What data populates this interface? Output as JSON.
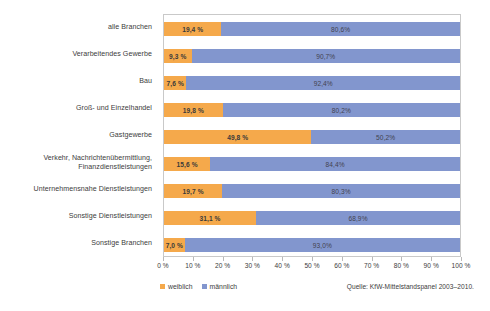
{
  "chart_data": {
    "type": "bar",
    "subtype": "stacked-horizontal-100",
    "title": "",
    "xlabel": "",
    "ylabel": "",
    "xlim": [
      0,
      100
    ],
    "xtick_labels": [
      "0 %",
      "10 %",
      "20 %",
      "30 %",
      "40 %",
      "50 %",
      "60 %",
      "70 %",
      "80 %",
      "90 %",
      "100 %"
    ],
    "xticks": [
      0,
      10,
      20,
      30,
      40,
      50,
      60,
      70,
      80,
      90,
      100
    ],
    "grid": false,
    "legend_position": "bottom-left",
    "categories": [
      "alle Branchen",
      "Verarbeitendes Gewerbe",
      "Bau",
      "Groß- und Einzelhandel",
      "Gastgewerbe",
      "Verkehr, Nachrichtenübermittlung,\nFinanzdienstleistungen",
      "Unternehmensnahe Dienstleistungen",
      "Sonstige Dienstleistungen",
      "Sonstige Branchen"
    ],
    "series": [
      {
        "name": "weiblich",
        "color": "#F5A94B",
        "values": [
          19.4,
          9.3,
          7.6,
          19.8,
          49.8,
          15.6,
          19.7,
          31.1,
          7.0
        ],
        "labels": [
          "19,4 %",
          "9,3 %",
          "7,6 %",
          "19,8 %",
          "49,8 %",
          "15,6 %",
          "19,7 %",
          "31,1 %",
          "7,0 %"
        ]
      },
      {
        "name": "männlich",
        "color": "#8296CE",
        "values": [
          80.6,
          90.7,
          92.4,
          80.2,
          50.2,
          84.4,
          80.3,
          68.9,
          93.0
        ],
        "labels": [
          "80,6%",
          "90,7%",
          "92,4%",
          "80,2%",
          "50,2%",
          "84,4%",
          "80,3%",
          "68,9%",
          "93,0%"
        ]
      }
    ],
    "source_note": "Quelle: KfW-Mittelstandspanel 2003–2010."
  },
  "legend": {
    "items": [
      {
        "label": "weiblich",
        "color": "#F5A94B"
      },
      {
        "label": "männlich",
        "color": "#8296CE"
      }
    ]
  },
  "source": {
    "text": "Quelle: KfW-Mittelstandspanel 2003–2010."
  }
}
